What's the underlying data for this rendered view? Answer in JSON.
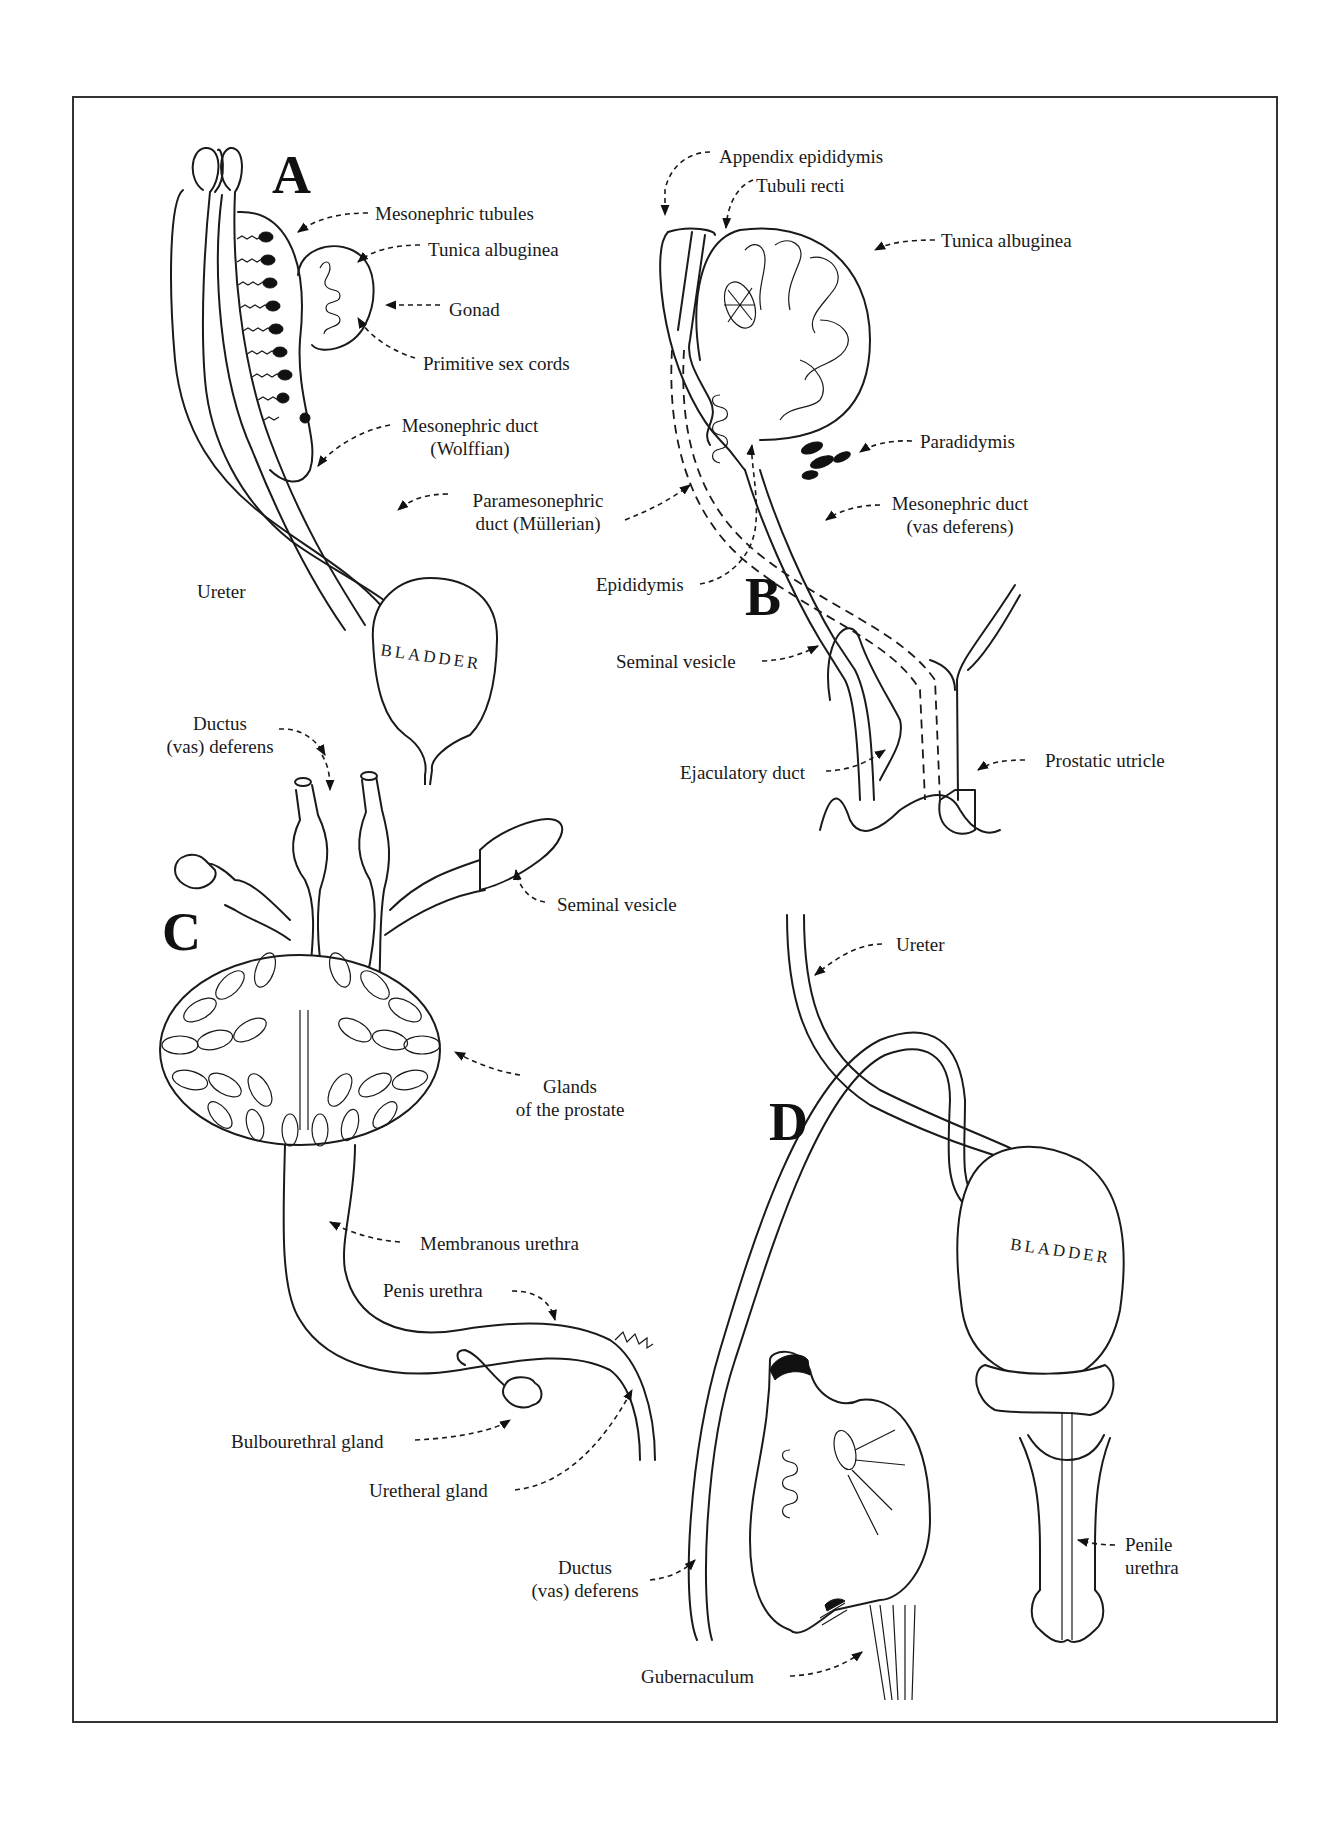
{
  "figure": {
    "panels": [
      {
        "id": "A",
        "letter": "A",
        "organ_label": "BLADDER",
        "labels": {
          "mesonephric_tubules": "Mesonephric tubules",
          "tunica_albuginea": "Tunica albuginea",
          "gonad": "Gonad",
          "primitive_sex_cords": "Primitive sex cords",
          "mesonephric_duct": "Mesonephric duct",
          "mesonephric_duct_sub": "(Wolffian)",
          "paramesonephric_duct": "Paramesonephric",
          "paramesonephric_duct_sub": "duct (Müllerian)",
          "ureter": "Ureter"
        }
      },
      {
        "id": "B",
        "letter": "B",
        "labels": {
          "appendix_epididymis": "Appendix epididymis",
          "tubuli_recti": "Tubuli recti",
          "tunica_albuginea": "Tunica albuginea",
          "paradidymis": "Paradidymis",
          "mesonephric_duct": "Mesonephric duct",
          "mesonephric_duct_sub": "(vas deferens)",
          "epididymis": "Epididymis",
          "seminal_vesicle": "Seminal vesicle",
          "ejaculatory_duct": "Ejaculatory duct",
          "prostatic_utricle": "Prostatic utricle"
        }
      },
      {
        "id": "C",
        "letter": "C",
        "labels": {
          "ductus_deferens": "Ductus",
          "ductus_deferens_sub": "(vas) deferens",
          "seminal_vesicle": "Seminal vesicle",
          "glands_prostate": "Glands",
          "glands_prostate_sub": "of the prostate",
          "membranous_urethra": "Membranous urethra",
          "penis_urethra": "Penis urethra",
          "bulbourethral_gland": "Bulbourethral gland",
          "uretheral_gland": "Uretheral gland"
        }
      },
      {
        "id": "D",
        "letter": "D",
        "organ_label": "BLADDER",
        "labels": {
          "ureter": "Ureter",
          "ductus_deferens": "Ductus",
          "ductus_deferens_sub": "(vas) deferens",
          "gubernaculum": "Gubernaculum",
          "penile_urethra": "Penile",
          "penile_urethra_sub": "urethra"
        }
      }
    ]
  }
}
